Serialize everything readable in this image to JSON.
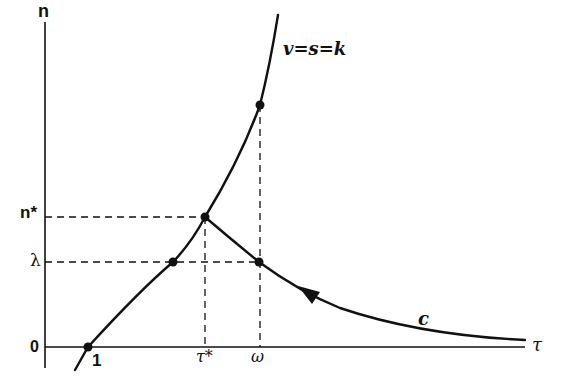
{
  "diagram": {
    "axes": {
      "y_label": "n",
      "x_label": "τ",
      "origin_label": "0"
    },
    "y_ticks": [
      {
        "label": "n*",
        "y": 217
      },
      {
        "label": "λ",
        "y": 262
      }
    ],
    "x_ticks": [
      {
        "label": "1",
        "x": 88
      },
      {
        "label": "τ*",
        "x": 205
      },
      {
        "label": "ω",
        "x": 259
      }
    ],
    "curves": [
      {
        "name": "v=s=k",
        "label": "v=s=k"
      },
      {
        "name": "c",
        "label": "c"
      }
    ],
    "points": [
      {
        "id": "one",
        "x": 88,
        "y": 347
      },
      {
        "id": "lambda-left",
        "x": 173,
        "y": 262
      },
      {
        "id": "peak",
        "x": 205,
        "y": 217
      },
      {
        "id": "lambda-right",
        "x": 259,
        "y": 262
      },
      {
        "id": "omega-top",
        "x": 260,
        "y": 105
      }
    ],
    "colors": {
      "ink": "#111111",
      "background": "#ffffff"
    }
  }
}
